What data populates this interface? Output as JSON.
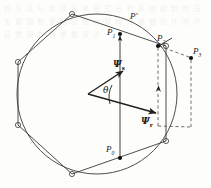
{
  "figure": {
    "type": "vector-diagram",
    "background_color": "#fdfdfb",
    "line_color": "#2b2b2b",
    "dashed_color": "#4a4a4a"
  },
  "labels": {
    "p_prime": "P′",
    "p0": "P",
    "p0_sub": "0",
    "p1": "P",
    "p1_sub": "1",
    "p2": "P",
    "p2_sub": "2",
    "p3": "P",
    "p3_sub": "3",
    "psi_s": "Ψ",
    "psi_s_sub": "s",
    "psi_r": "Ψ",
    "psi_r_sub": "r",
    "theta": "θ"
  },
  "geometry": {
    "circle": {
      "cx": 97,
      "cy": 94,
      "r": 80
    },
    "hexagon_vertices": [
      [
        72,
        14
      ],
      [
        166,
        46
      ],
      [
        166,
        141
      ],
      [
        72,
        174
      ],
      [
        18,
        125
      ],
      [
        18,
        62
      ]
    ],
    "points": {
      "P0": [
        120,
        158
      ],
      "P1": [
        120,
        34
      ],
      "P_prime": [
        127,
        20
      ],
      "P2": [
        158,
        46
      ],
      "P3": [
        191,
        58
      ],
      "origin": [
        88,
        94
      ]
    },
    "psi_s_vector": {
      "from": [
        88,
        94
      ],
      "to": [
        124,
        70
      ]
    },
    "psi_r_vector": {
      "from": [
        88,
        94
      ],
      "to": [
        158,
        114
      ]
    },
    "angle_theta_deg": 34
  },
  "background_text": "的 方 法 与 实 现 技 术 研 究 分 析 系 统 控 制 电 压 矢 量 调 制 策 略 优 化 计 算 转 矩 磁 链 估 计 闭 环 反 馈 调 节 器 参 数 设 计"
}
